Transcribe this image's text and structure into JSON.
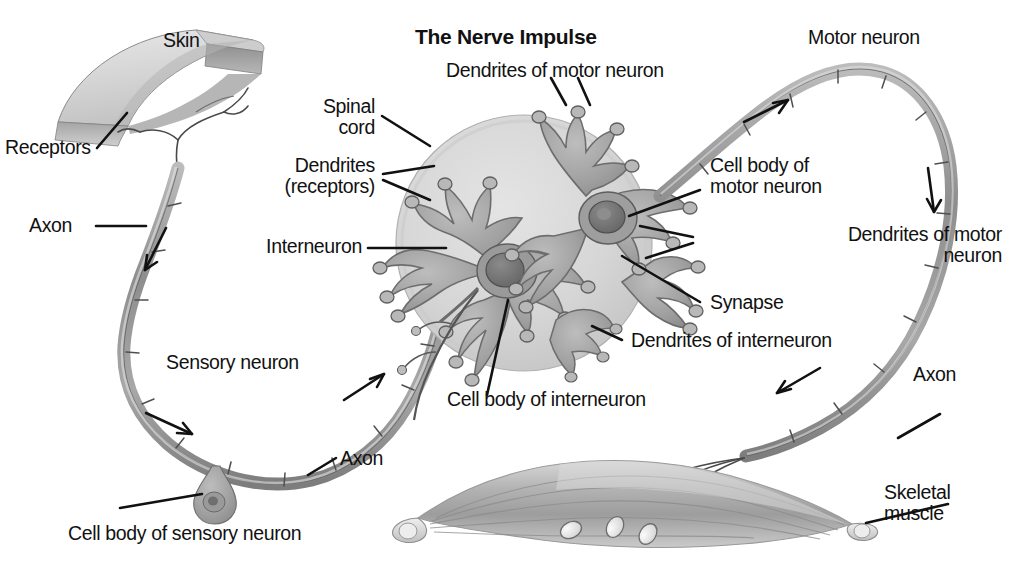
{
  "figure": {
    "title": "The Nerve Impulse",
    "background_color": "#ffffff",
    "ink_color": "#111111"
  },
  "labels": {
    "skin": "Skin",
    "receptors": "Receptors",
    "axon_sensory_upper": "Axon",
    "sensory_neuron": "Sensory neuron",
    "axon_sensory_lower": "Axon",
    "cell_body_sensory": "Cell body of sensory neuron",
    "spinal_cord": "Spinal\ncord",
    "dendrites_receptors": "Dendrites\n(receptors)",
    "interneuron": "Interneuron",
    "dendrites_motor_top": "Dendrites of motor neuron",
    "cell_body_motor": "Cell body of\nmotor neuron",
    "dendrites_motor_right": "Dendrites of motor\nneuron",
    "synapse": "Synapse",
    "dendrites_interneuron": "Dendrites of interneuron",
    "cell_body_interneuron": "Cell body of interneuron",
    "motor_neuron": "Motor neuron",
    "axon_motor": "Axon",
    "skeletal_muscle": "Skeletal\nmuscle"
  },
  "structures": [
    {
      "name": "skin-slab",
      "tone": "#d9d9d9"
    },
    {
      "name": "sensory-neuron-fiber",
      "tone": "#9a9a9a"
    },
    {
      "name": "sensory-cell-body",
      "tone": "#a8a8a8"
    },
    {
      "name": "spinal-cord-cross-section",
      "tone": "#d2d2d2"
    },
    {
      "name": "interneuron",
      "tone": "#a5a5a5"
    },
    {
      "name": "motor-neuron-soma",
      "tone": "#a5a5a5"
    },
    {
      "name": "motor-neuron-fiber",
      "tone": "#9a9a9a"
    },
    {
      "name": "skeletal-muscle",
      "tone": "#bdbdbd"
    },
    {
      "name": "motor-end-plates",
      "count": 3
    }
  ],
  "impulse_arrows": [
    {
      "name": "arrow-sensory-down",
      "direction": "down-right"
    },
    {
      "name": "arrow-sensory-bottom",
      "direction": "right-down"
    },
    {
      "name": "arrow-sensory-to-cord",
      "direction": "up-right"
    },
    {
      "name": "arrow-motor-top",
      "direction": "up-right"
    },
    {
      "name": "arrow-motor-right",
      "direction": "down"
    },
    {
      "name": "arrow-motor-to-muscle",
      "direction": "down-left"
    }
  ]
}
